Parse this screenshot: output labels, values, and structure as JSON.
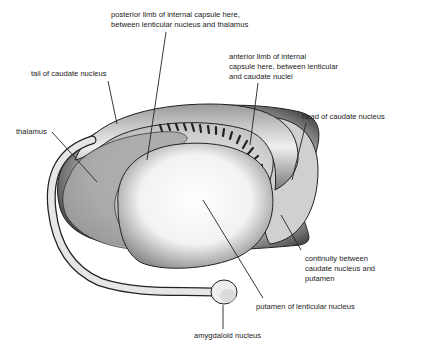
{
  "diagram": {
    "colors": {
      "ink": "#222222",
      "background": "#ffffff",
      "shade": "#555555"
    },
    "labels": [
      {
        "id": "posterior_limb",
        "text": "posterior limb of internal capsule here,\nbetween lenticular nucleus and thalamus",
        "x": 111,
        "y": 10
      },
      {
        "id": "anterior_limb",
        "text": "anterior limb of internal\ncapsule here, between lenticular\nand caudate nuclei",
        "x": 229,
        "y": 52
      },
      {
        "id": "tail_caudate",
        "text": "tail of caudate nucleus",
        "x": 31,
        "y": 69
      },
      {
        "id": "head_caudate",
        "text": "head of caudate nucleus",
        "x": 302,
        "y": 112
      },
      {
        "id": "thalamus",
        "text": "thalamus",
        "x": 16,
        "y": 127
      },
      {
        "id": "continuity",
        "text": "continuity between\ncaudate nucleus and\nputamen",
        "x": 305,
        "y": 254
      },
      {
        "id": "putamen",
        "text": "putamen of lenticular nucleus",
        "x": 256,
        "y": 302
      },
      {
        "id": "amygdaloid",
        "text": "amygdaloid nucleus",
        "x": 194,
        "y": 331
      }
    ]
  }
}
